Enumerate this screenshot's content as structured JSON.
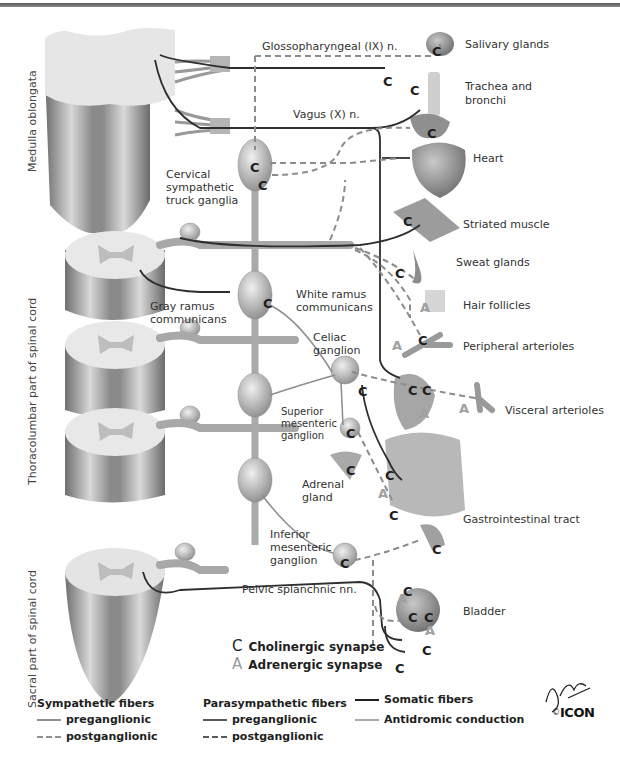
{
  "colors": {
    "cord_light": "#e4e4e4",
    "cord_dark": "#7d7d7d",
    "sympathetic_pre": "#8f8f8f",
    "sympathetic_post": "#8f8f8f",
    "parasympathetic_pre": "#5a5a5a",
    "parasympathetic_post": "#5a5a5a",
    "somatic": "#1e1e1e",
    "antidromic": "#a9a9a9",
    "cholinergic_symbol": "#1e1e1e",
    "adrenergic_symbol": "#9a9a9a"
  },
  "region_labels": {
    "medulla": "Medulla oblongata",
    "thoracolumbar": "Thoracolumbar part of spinal cord",
    "sacral": "Sacral part of spinal cord"
  },
  "nerve_labels": {
    "glossopharyngeal": "Glossopharyngeal (IX) n.",
    "vagus": "Vagus (X) n.",
    "pelvic_splanchnic": "Pelvic splanchnic nn."
  },
  "structure_labels": {
    "cervical_ganglia": [
      "Cervical",
      "sympathetic",
      "truck ganglia"
    ],
    "gray_ramus": [
      "Gray ramus",
      "communicans"
    ],
    "white_ramus": [
      "White ramus",
      "communicans"
    ],
    "celiac": [
      "Celiac",
      "ganglion"
    ],
    "superior_mesenteric": [
      "Superior",
      "mesenteric",
      "ganglion"
    ],
    "adrenal": [
      "Adrenal",
      "gland"
    ],
    "inferior_mesenteric": [
      "Inferior",
      "mesenteric",
      "ganglion"
    ]
  },
  "target_organs": [
    {
      "id": "salivary",
      "label": "Salivary glands"
    },
    {
      "id": "trachea",
      "label": "Trachea and"
    },
    {
      "id": "trachea2",
      "label": "bronchi"
    },
    {
      "id": "heart",
      "label": "Heart"
    },
    {
      "id": "striated",
      "label": "Striated muscle"
    },
    {
      "id": "sweat",
      "label": "Sweat glands"
    },
    {
      "id": "hair",
      "label": "Hair follicles"
    },
    {
      "id": "peripheral",
      "label": "Peripheral arterioles"
    },
    {
      "id": "visceral",
      "label": "Visceral arterioles"
    },
    {
      "id": "gi",
      "label": "Gastrointestinal tract"
    },
    {
      "id": "bladder",
      "label": "Bladder"
    }
  ],
  "synapse_legend": [
    {
      "glyph": "C",
      "label": "Cholinergic synapse"
    },
    {
      "glyph": "A",
      "label": "Adrenergic synapse"
    }
  ],
  "fiber_legend": {
    "sympathetic": {
      "title": "Sympathetic fibers",
      "pre": "preganglionic",
      "post": "postganglionic"
    },
    "parasympathetic": {
      "title": "Parasympathetic fibers",
      "pre": "preganglionic",
      "post": "postganglionic"
    },
    "other": [
      {
        "style": "solid",
        "label": "Somatic fibers"
      },
      {
        "style": "solid",
        "label": "Antidromic conduction"
      }
    ]
  },
  "credits": {
    "signature": "F. Netter M.D.",
    "copyright": "©",
    "logo": "ICON"
  }
}
